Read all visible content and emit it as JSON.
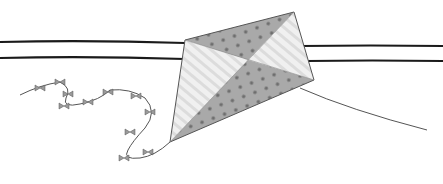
{
  "scene": {
    "description": "Pencil illustration of a kite tangled on two power lines, with a bow-tied tail trailing left and a string trailing right",
    "colors": {
      "background": "#ffffff",
      "wire": "#1a1a1a",
      "kite_dark_panel": "#a9a9a9",
      "kite_light_panel": "#ececec",
      "dots": "#6e6e6e",
      "outline": "#555555"
    },
    "elements": [
      "power-line-upper",
      "power-line-lower",
      "kite",
      "kite-tail-with-bows",
      "kite-string"
    ]
  }
}
